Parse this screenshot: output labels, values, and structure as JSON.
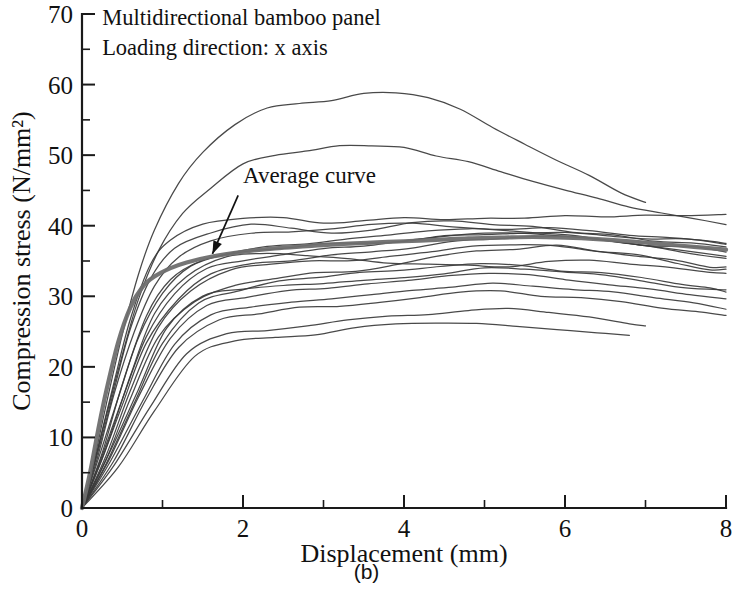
{
  "figure": {
    "caption": "(b)",
    "notes": [
      "Multidirectional bamboo panel",
      "Loading direction: x axis"
    ],
    "annotation_label": "Average curve"
  },
  "chart_data": {
    "type": "line",
    "title": "",
    "subtitle": "",
    "xlabel": "Displacement (mm)",
    "ylabel": "Compression stress (N/mm²)",
    "xlim": [
      0,
      8
    ],
    "ylim": [
      0,
      70
    ],
    "x_major_ticks": [
      0,
      2,
      4,
      6,
      8
    ],
    "x_minor_ticks": [
      1,
      3,
      5,
      7
    ],
    "y_major_ticks": [
      0,
      10,
      20,
      30,
      40,
      50,
      60,
      70
    ],
    "y_minor_ticks": [
      5,
      15,
      25,
      35,
      45,
      55,
      65
    ],
    "grid": false,
    "legend": "none",
    "annotations": [
      {
        "text": "Average curve",
        "text_x": 2.0,
        "text_y": 46.0,
        "arrow_from_x": 1.94,
        "arrow_from_y": 44.3,
        "arrow_to_x": 1.62,
        "arrow_to_y": 36.0
      }
    ],
    "notes_position": {
      "x": 0.25,
      "y": 68.5
    },
    "series": [
      {
        "name": "average",
        "style": "thick-gray",
        "x": [
          0,
          0.1,
          0.2,
          0.3,
          0.45,
          0.6,
          0.75,
          0.9,
          1.1,
          1.3,
          1.6,
          2.0,
          2.4,
          2.8,
          3.2,
          3.6,
          4.0,
          4.4,
          4.8,
          5.2,
          5.6,
          6.0,
          6.4,
          6.8,
          7.2,
          7.6,
          8.0
        ],
        "y": [
          0,
          5.0,
          11.0,
          16.5,
          23.5,
          28.4,
          31.3,
          32.8,
          34.0,
          34.8,
          35.6,
          36.3,
          36.8,
          37.1,
          37.4,
          37.6,
          37.8,
          38.0,
          38.2,
          38.3,
          38.4,
          38.3,
          38.1,
          37.8,
          37.4,
          37.0,
          36.6
        ]
      },
      {
        "name": "specimen-01",
        "style": "thin",
        "x": [
          0,
          0.15,
          0.3,
          0.5,
          0.7,
          0.9,
          1.2,
          1.5,
          1.9,
          2.3,
          2.7,
          3.1,
          3.5,
          3.9,
          4.3,
          4.7,
          5.1,
          5.5,
          5.9,
          6.3,
          6.7,
          7.0
        ],
        "y": [
          0,
          7.0,
          14.5,
          24.5,
          33.0,
          39.5,
          46.0,
          50.5,
          54.5,
          56.7,
          57.3,
          57.6,
          58.5,
          58.7,
          58.2,
          56.6,
          54.0,
          51.5,
          49.5,
          47.0,
          44.5,
          43.3
        ]
      },
      {
        "name": "specimen-02",
        "style": "thin",
        "x": [
          0,
          0.15,
          0.3,
          0.5,
          0.7,
          0.95,
          1.25,
          1.6,
          2.0,
          2.4,
          2.8,
          3.2,
          3.6,
          4.0,
          4.4,
          4.8,
          5.2,
          5.6,
          6.0,
          6.4,
          6.8,
          7.2,
          7.6,
          8.0
        ],
        "y": [
          0,
          6.0,
          13.0,
          21.5,
          29.5,
          36.5,
          42.0,
          45.5,
          48.5,
          50.0,
          50.8,
          51.2,
          51.3,
          50.9,
          50.1,
          49.0,
          47.5,
          46.3,
          45.2,
          44.0,
          42.8,
          41.7,
          40.8,
          40.0
        ]
      },
      {
        "name": "specimen-03",
        "style": "thin",
        "x": [
          0,
          0.2,
          0.4,
          0.6,
          0.85,
          1.1,
          1.5,
          2.0,
          2.5,
          3.0,
          3.5,
          4.0,
          4.5,
          5.0,
          5.5,
          6.0,
          6.5,
          7.0,
          7.5,
          8.0
        ],
        "y": [
          0,
          8.5,
          18.0,
          27.0,
          34.5,
          38.0,
          40.2,
          41.3,
          41.0,
          40.4,
          40.6,
          41.0,
          41.1,
          40.8,
          40.9,
          41.2,
          41.4,
          41.6,
          41.5,
          41.4
        ]
      },
      {
        "name": "specimen-04",
        "style": "thin",
        "x": [
          0,
          0.2,
          0.4,
          0.6,
          0.85,
          1.15,
          1.6,
          2.1,
          2.6,
          3.1,
          3.6,
          4.1,
          4.6,
          5.1,
          5.6,
          6.1,
          6.6,
          7.1,
          7.6,
          8.0
        ],
        "y": [
          0,
          8.0,
          17.0,
          25.5,
          32.5,
          36.8,
          39.2,
          40.0,
          39.6,
          39.0,
          39.5,
          40.3,
          40.6,
          40.4,
          39.9,
          39.2,
          38.6,
          38.0,
          37.5,
          37.0
        ]
      },
      {
        "name": "specimen-05",
        "style": "thin",
        "x": [
          0,
          0.2,
          0.4,
          0.65,
          0.9,
          1.2,
          1.6,
          2.1,
          2.6,
          3.1,
          3.6,
          4.1,
          4.6,
          5.1,
          5.6,
          6.1,
          6.6,
          7.1,
          7.6,
          8.0
        ],
        "y": [
          0,
          7.5,
          16.0,
          25.0,
          31.5,
          35.5,
          37.8,
          38.8,
          39.2,
          39.6,
          40.0,
          40.2,
          40.0,
          39.6,
          39.2,
          38.6,
          38.0,
          37.4,
          36.9,
          36.5
        ]
      },
      {
        "name": "specimen-06",
        "style": "thin",
        "x": [
          0,
          0.2,
          0.45,
          0.7,
          1.0,
          1.35,
          1.8,
          2.3,
          2.8,
          3.3,
          3.8,
          4.3,
          4.8,
          5.3,
          5.8,
          6.3,
          6.8,
          7.3,
          7.8,
          8.0
        ],
        "y": [
          0,
          7.0,
          15.5,
          24.0,
          30.5,
          34.2,
          36.2,
          37.0,
          37.6,
          38.2,
          38.7,
          39.1,
          39.4,
          39.6,
          39.5,
          39.1,
          38.6,
          38.1,
          37.6,
          37.4
        ]
      },
      {
        "name": "specimen-07",
        "style": "thin",
        "x": [
          0,
          0.25,
          0.5,
          0.8,
          1.1,
          1.5,
          2.0,
          2.5,
          3.0,
          3.5,
          4.0,
          4.5,
          5.0,
          5.5,
          6.0,
          6.5,
          7.0,
          7.5,
          8.0
        ],
        "y": [
          0,
          8.0,
          17.5,
          27.0,
          32.5,
          35.0,
          36.2,
          36.8,
          37.2,
          37.6,
          38.0,
          38.4,
          38.8,
          39.0,
          39.0,
          38.8,
          38.4,
          38.0,
          37.6
        ]
      },
      {
        "name": "specimen-08",
        "style": "thin",
        "x": [
          0,
          0.25,
          0.5,
          0.8,
          1.15,
          1.55,
          2.0,
          2.5,
          3.0,
          3.5,
          4.0,
          4.5,
          5.0,
          5.5,
          6.0,
          6.5,
          7.0,
          7.5,
          8.0
        ],
        "y": [
          0,
          7.2,
          15.5,
          24.5,
          30.5,
          33.8,
          35.2,
          36.0,
          36.6,
          37.2,
          37.8,
          38.3,
          38.7,
          38.9,
          38.6,
          38.0,
          37.2,
          36.4,
          35.8
        ]
      },
      {
        "name": "specimen-09",
        "style": "thin",
        "x": [
          0,
          0.25,
          0.5,
          0.8,
          1.2,
          1.6,
          2.1,
          2.6,
          3.1,
          3.6,
          4.1,
          4.6,
          5.1,
          5.6,
          6.1,
          6.6,
          7.1,
          7.6,
          8.0
        ],
        "y": [
          0,
          6.8,
          14.8,
          23.5,
          29.8,
          33.0,
          34.5,
          35.2,
          35.8,
          36.4,
          37.0,
          37.6,
          38.1,
          38.4,
          38.2,
          37.6,
          36.8,
          36.0,
          35.4
        ]
      },
      {
        "name": "specimen-10",
        "style": "thin",
        "x": [
          0,
          0.3,
          0.6,
          0.9,
          1.3,
          1.8,
          2.3,
          2.8,
          3.3,
          3.8,
          4.3,
          4.8,
          5.3,
          5.8,
          6.3,
          6.8,
          7.3,
          7.8,
          8.0
        ],
        "y": [
          0,
          8.5,
          18.5,
          27.5,
          33.0,
          35.4,
          36.2,
          36.0,
          35.4,
          34.8,
          34.4,
          34.2,
          34.4,
          34.8,
          35.0,
          34.8,
          34.2,
          33.5,
          33.2
        ]
      },
      {
        "name": "specimen-11",
        "style": "thin",
        "x": [
          0,
          0.3,
          0.6,
          0.95,
          1.35,
          1.85,
          2.35,
          2.85,
          3.35,
          3.85,
          4.35,
          4.85,
          5.35,
          5.85,
          6.35,
          6.85,
          7.35,
          7.8,
          8.0
        ],
        "y": [
          0,
          7.5,
          16.5,
          25.5,
          31.0,
          33.5,
          34.4,
          34.8,
          35.2,
          35.8,
          36.4,
          36.9,
          37.2,
          37.0,
          36.5,
          35.8,
          35.0,
          34.3,
          34.0
        ]
      },
      {
        "name": "specimen-12",
        "style": "thin",
        "x": [
          0,
          0.3,
          0.6,
          0.95,
          1.4,
          1.9,
          2.4,
          2.9,
          3.4,
          3.9,
          4.4,
          4.9,
          5.4,
          5.9,
          6.4,
          6.9,
          7.4,
          7.8,
          8.0
        ],
        "y": [
          0,
          7.0,
          15.5,
          24.0,
          29.5,
          31.8,
          32.6,
          33.2,
          33.8,
          34.6,
          35.4,
          36.2,
          36.8,
          37.0,
          36.6,
          35.8,
          34.8,
          34.0,
          33.6
        ]
      },
      {
        "name": "specimen-13",
        "style": "thin",
        "x": [
          0,
          0.3,
          0.65,
          1.0,
          1.45,
          1.95,
          2.45,
          2.95,
          3.45,
          3.95,
          4.45,
          4.95,
          5.45,
          5.95,
          6.45,
          6.95,
          7.45,
          7.8,
          8.0
        ],
        "y": [
          0,
          6.5,
          15.0,
          23.5,
          28.8,
          31.0,
          32.0,
          32.6,
          33.2,
          33.8,
          34.2,
          34.4,
          34.2,
          33.8,
          33.2,
          32.4,
          31.6,
          31.0,
          30.8
        ]
      },
      {
        "name": "specimen-14",
        "style": "thin",
        "x": [
          0,
          0.35,
          0.7,
          1.05,
          1.5,
          2.0,
          2.5,
          3.0,
          3.5,
          4.0,
          4.5,
          5.0,
          5.5,
          6.0,
          6.5,
          7.0,
          7.5,
          8.0
        ],
        "y": [
          0,
          7.8,
          17.0,
          25.5,
          29.8,
          31.2,
          31.6,
          31.8,
          32.2,
          32.8,
          33.4,
          33.8,
          33.9,
          33.6,
          33.0,
          32.2,
          31.4,
          30.8
        ]
      },
      {
        "name": "specimen-15",
        "style": "thin",
        "x": [
          0,
          0.35,
          0.7,
          1.1,
          1.55,
          2.05,
          2.55,
          3.05,
          3.55,
          4.05,
          4.55,
          5.05,
          5.55,
          6.05,
          6.55,
          7.05,
          7.55,
          8.0
        ],
        "y": [
          0,
          7.0,
          15.5,
          24.0,
          28.5,
          30.0,
          30.6,
          31.2,
          31.8,
          32.4,
          32.8,
          33.0,
          32.8,
          32.4,
          31.8,
          31.0,
          30.2,
          29.6
        ]
      },
      {
        "name": "specimen-16",
        "style": "thin",
        "x": [
          0,
          0.35,
          0.75,
          1.15,
          1.6,
          2.1,
          2.6,
          3.1,
          3.6,
          4.1,
          4.6,
          5.1,
          5.6,
          6.1,
          6.6,
          7.1,
          7.6,
          8.0
        ],
        "y": [
          0,
          6.5,
          15.0,
          23.0,
          27.2,
          28.6,
          29.2,
          29.8,
          30.4,
          31.0,
          31.4,
          31.6,
          31.4,
          31.0,
          30.4,
          29.6,
          28.8,
          28.2
        ]
      },
      {
        "name": "specimen-17",
        "style": "thin",
        "x": [
          0,
          0.4,
          0.8,
          1.2,
          1.7,
          2.2,
          2.7,
          3.2,
          3.7,
          4.2,
          4.7,
          5.2,
          5.7,
          6.2,
          6.7,
          7.2,
          7.7,
          8.0
        ],
        "y": [
          0,
          6.8,
          15.5,
          23.0,
          26.5,
          27.6,
          28.2,
          28.8,
          29.4,
          30.0,
          30.4,
          30.5,
          30.2,
          29.8,
          29.2,
          28.5,
          27.8,
          27.4
        ]
      },
      {
        "name": "specimen-18",
        "style": "thin",
        "x": [
          0,
          0.4,
          0.85,
          1.3,
          1.8,
          2.3,
          2.8,
          3.3,
          3.8,
          4.3,
          4.8,
          5.3,
          5.8,
          6.3,
          6.8,
          7.0
        ],
        "y": [
          0,
          6.2,
          14.5,
          22.0,
          24.6,
          25.2,
          25.8,
          26.4,
          27.0,
          27.6,
          28.0,
          28.0,
          27.6,
          27.0,
          26.2,
          25.8
        ]
      },
      {
        "name": "specimen-19",
        "style": "thin",
        "x": [
          0,
          0.45,
          0.9,
          1.4,
          1.9,
          2.4,
          2.9,
          3.4,
          3.9,
          4.4,
          4.9,
          5.4,
          5.9,
          6.4,
          6.8
        ],
        "y": [
          0,
          6.0,
          14.0,
          21.5,
          23.6,
          24.2,
          24.8,
          25.4,
          26.0,
          26.4,
          26.4,
          26.0,
          25.4,
          24.7,
          24.2
        ]
      }
    ]
  }
}
